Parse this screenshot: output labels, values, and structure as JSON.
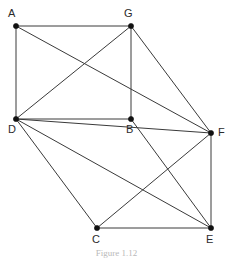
{
  "figure": {
    "caption": "Figure 1.12",
    "background_color": "#ffffff",
    "edge_color": "#3a3a3a",
    "vertex_color": "#111111",
    "label_color": "#2b2b2b"
  },
  "graph_data": {
    "type": "graph",
    "directed": false,
    "vertex_count": 7,
    "edge_count": 14,
    "vertices": [
      {
        "id": "A",
        "label": "A",
        "x": 16,
        "y": 26,
        "label_x": 8,
        "label_y": 8,
        "degree": 3
      },
      {
        "id": "G",
        "label": "G",
        "x": 131,
        "y": 26,
        "label_x": 124,
        "label_y": 8,
        "degree": 4
      },
      {
        "id": "D",
        "label": "D",
        "x": 16,
        "y": 119,
        "label_x": 8,
        "label_y": 124,
        "degree": 6
      },
      {
        "id": "B",
        "label": "B",
        "x": 131,
        "y": 119,
        "label_x": 126,
        "label_y": 124,
        "degree": 3
      },
      {
        "id": "F",
        "label": "F",
        "x": 211,
        "y": 133,
        "label_x": 218,
        "label_y": 127,
        "degree": 5
      },
      {
        "id": "C",
        "label": "C",
        "x": 97,
        "y": 228,
        "label_x": 92,
        "label_y": 234,
        "degree": 3
      },
      {
        "id": "E",
        "label": "E",
        "x": 211,
        "y": 228,
        "label_x": 206,
        "label_y": 234,
        "degree": 4
      }
    ],
    "edges": [
      {
        "from": "A",
        "to": "G"
      },
      {
        "from": "A",
        "to": "D"
      },
      {
        "from": "A",
        "to": "F"
      },
      {
        "from": "G",
        "to": "D"
      },
      {
        "from": "G",
        "to": "B"
      },
      {
        "from": "G",
        "to": "F"
      },
      {
        "from": "D",
        "to": "B"
      },
      {
        "from": "D",
        "to": "C"
      },
      {
        "from": "D",
        "to": "F"
      },
      {
        "from": "D",
        "to": "E"
      },
      {
        "from": "B",
        "to": "E"
      },
      {
        "from": "C",
        "to": "F"
      },
      {
        "from": "C",
        "to": "E"
      },
      {
        "from": "F",
        "to": "E"
      }
    ]
  }
}
